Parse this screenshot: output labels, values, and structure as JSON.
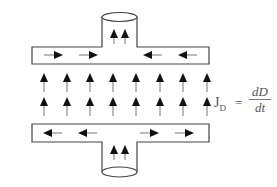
{
  "diagram": {
    "equation": {
      "lhs": "J",
      "lhs_sub": "D",
      "equals": "=",
      "numerator": "dD",
      "denominator": "dt"
    },
    "top_plate": {
      "lead_arrows": 2,
      "lead_arrow_direction": "up",
      "surface_arrows": [
        "right",
        "right",
        "left",
        "left"
      ]
    },
    "bottom_plate": {
      "lead_arrows": 2,
      "lead_arrow_direction": "up",
      "surface_arrows": [
        "left",
        "left",
        "right",
        "right"
      ]
    },
    "field_arrows": {
      "rows": 2,
      "columns": 8,
      "direction": "up"
    },
    "colors": {
      "stroke": "#333333",
      "arrow": "#111111",
      "shaft": "#777777",
      "background": "#ffffff"
    }
  }
}
